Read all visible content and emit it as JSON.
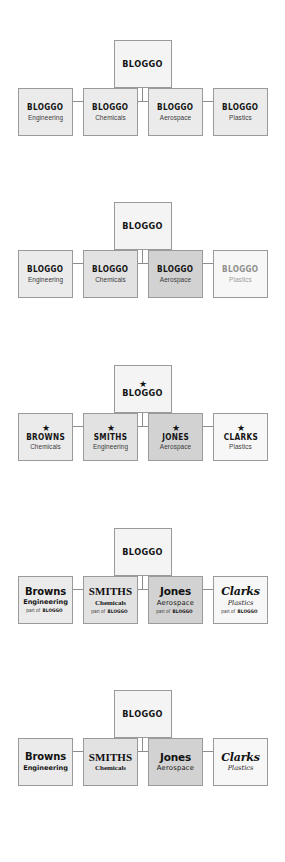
{
  "brand": {
    "parent_name": "BLOGGO",
    "star_glyph": "★",
    "part_of_prefix": "part of ",
    "part_of_brand": "BLOGGO"
  },
  "colors": {
    "fill_light": "#ebebeb",
    "fill_mid": "#e2e2e2",
    "fill_dark": "#d2d2d2",
    "fill_pale": "#f7f7f7",
    "border": "#9a9a9a",
    "connector": "#8d8d8d",
    "text": "#141414",
    "text_muted": "#9d9d9d"
  },
  "charts": [
    {
      "id": "monolithic-identity",
      "parent": {
        "name": "BLOGGO"
      },
      "children": [
        {
          "name": "BLOGGO",
          "descriptor": "Engineering"
        },
        {
          "name": "BLOGGO",
          "descriptor": "Chemicals"
        },
        {
          "name": "BLOGGO",
          "descriptor": "Aerospace"
        },
        {
          "name": "BLOGGO",
          "descriptor": "Plastics"
        }
      ]
    },
    {
      "id": "monolithic-graduated",
      "parent": {
        "name": "BLOGGO"
      },
      "children": [
        {
          "name": "BLOGGO",
          "descriptor": "Engineering"
        },
        {
          "name": "BLOGGO",
          "descriptor": "Chemicals"
        },
        {
          "name": "BLOGGO",
          "descriptor": "Aerospace"
        },
        {
          "name": "BLOGGO",
          "descriptor": "Plastics"
        }
      ]
    },
    {
      "id": "endorsed-star",
      "parent": {
        "name": "BLOGGO",
        "mark": "★"
      },
      "children": [
        {
          "name": "BROWNS",
          "descriptor": "Chemicals",
          "mark": "★"
        },
        {
          "name": "SMITHS",
          "descriptor": "Engineering",
          "mark": "★"
        },
        {
          "name": "JONES",
          "descriptor": "Aerospace",
          "mark": "★"
        },
        {
          "name": "CLARKS",
          "descriptor": "Plastics",
          "mark": "★"
        }
      ]
    },
    {
      "id": "endorsed-partof",
      "parent": {
        "name": "BLOGGO"
      },
      "children": [
        {
          "name": "Browns",
          "descriptor": "Engineering",
          "endorsement": "part of BLOGGO"
        },
        {
          "name": "SMITHS",
          "descriptor": "Chemicals",
          "endorsement": "part of BLOGGO"
        },
        {
          "name": "Jones",
          "descriptor": "Aerospace",
          "endorsement": "part of BLOGGO"
        },
        {
          "name": "Clarks",
          "descriptor": "Plastics",
          "endorsement": "part of BLOGGO"
        }
      ]
    },
    {
      "id": "house-of-brands",
      "parent": {
        "name": "BLOGGO"
      },
      "children": [
        {
          "name": "Browns",
          "descriptor": "Engineering"
        },
        {
          "name": "SMITHS",
          "descriptor": "Chemicals"
        },
        {
          "name": "Jones",
          "descriptor": "Aerospace"
        },
        {
          "name": "Clarks",
          "descriptor": "Plastics"
        }
      ]
    }
  ]
}
